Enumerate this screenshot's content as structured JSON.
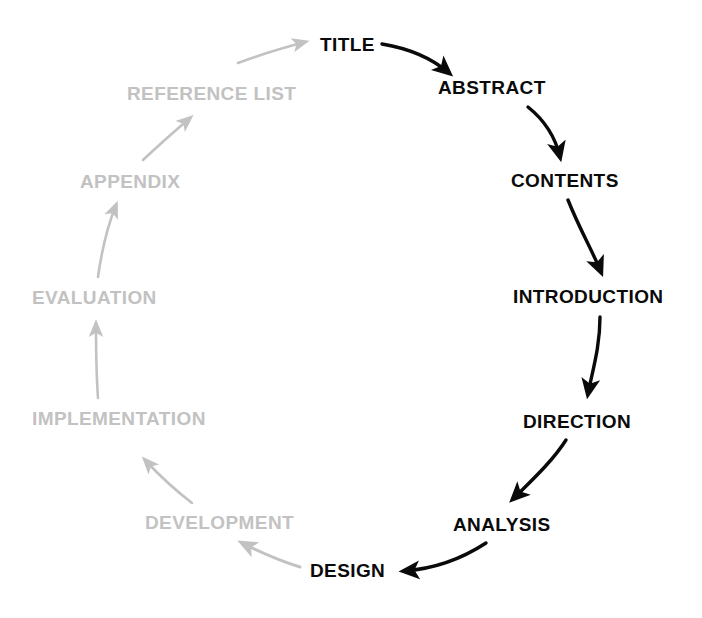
{
  "diagram": {
    "type": "cycle",
    "colors": {
      "active": "#0a0a0a",
      "faded": "#c2c2c2",
      "background": "#ffffff"
    },
    "nodes": [
      {
        "id": "title",
        "label": "TITLE",
        "state": "active",
        "x": 320,
        "y": 35,
        "anchor": "left"
      },
      {
        "id": "abstract",
        "label": "ABSTRACT",
        "state": "active",
        "x": 438,
        "y": 78,
        "anchor": "left"
      },
      {
        "id": "contents",
        "label": "CONTENTS",
        "state": "active",
        "x": 511,
        "y": 171,
        "anchor": "left"
      },
      {
        "id": "introduction",
        "label": "INTRODUCTION",
        "state": "active",
        "x": 513,
        "y": 287,
        "anchor": "left"
      },
      {
        "id": "direction",
        "label": "DIRECTION",
        "state": "active",
        "x": 523,
        "y": 412,
        "anchor": "left"
      },
      {
        "id": "analysis",
        "label": "ANALYSIS",
        "state": "active",
        "x": 453,
        "y": 515,
        "anchor": "left"
      },
      {
        "id": "design",
        "label": "DESIGN",
        "state": "active",
        "x": 310,
        "y": 561,
        "anchor": "left"
      },
      {
        "id": "development",
        "label": "DEVELOPMENT",
        "state": "faded",
        "x": 145,
        "y": 513,
        "anchor": "left"
      },
      {
        "id": "implementation",
        "label": "IMPLEMENTATION",
        "state": "faded",
        "x": 32,
        "y": 409,
        "anchor": "left"
      },
      {
        "id": "evaluation",
        "label": "EVALUATION",
        "state": "faded",
        "x": 32,
        "y": 288,
        "anchor": "left"
      },
      {
        "id": "appendix",
        "label": "APPENDIX",
        "state": "faded",
        "x": 80,
        "y": 172,
        "anchor": "left"
      },
      {
        "id": "reference_list",
        "label": "REFERENCE  LIST",
        "state": "faded",
        "x": 127,
        "y": 84,
        "anchor": "left"
      }
    ],
    "edges": [
      {
        "from": "title",
        "to": "abstract",
        "state": "active"
      },
      {
        "from": "abstract",
        "to": "contents",
        "state": "active"
      },
      {
        "from": "contents",
        "to": "introduction",
        "state": "active"
      },
      {
        "from": "introduction",
        "to": "direction",
        "state": "active"
      },
      {
        "from": "direction",
        "to": "analysis",
        "state": "active"
      },
      {
        "from": "analysis",
        "to": "design",
        "state": "active"
      },
      {
        "from": "design",
        "to": "development",
        "state": "faded"
      },
      {
        "from": "development",
        "to": "implementation",
        "state": "faded"
      },
      {
        "from": "implementation",
        "to": "evaluation",
        "state": "faded"
      },
      {
        "from": "evaluation",
        "to": "appendix",
        "state": "faded"
      },
      {
        "from": "appendix",
        "to": "reference_list",
        "state": "faded"
      },
      {
        "from": "reference_list",
        "to": "title",
        "state": "faded"
      }
    ]
  }
}
